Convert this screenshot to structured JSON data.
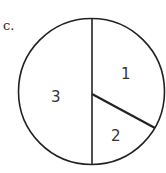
{
  "figure": {
    "part_label": "c.",
    "shape": "circle",
    "colors": {
      "stroke": "#222222",
      "fill": "#ffffff",
      "text": "#333333"
    },
    "regions": [
      {
        "id": "region-1",
        "label": "1",
        "approx_fraction": 0.33
      },
      {
        "id": "region-2",
        "label": "2",
        "approx_fraction": 0.17
      },
      {
        "id": "region-3",
        "label": "3",
        "approx_fraction": 0.5
      }
    ]
  }
}
